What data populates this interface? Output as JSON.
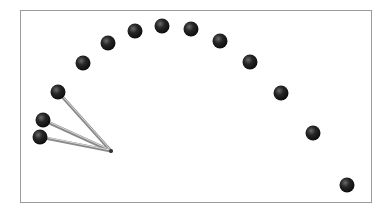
{
  "diagram": {
    "frame": {
      "x": 20,
      "y": 10,
      "width": 352,
      "height": 193,
      "border_color": "#9a9a9a"
    },
    "ball_color": "#262626",
    "stick_color": "#8a8a8a",
    "pivot": {
      "x": 111,
      "y": 151
    },
    "trajectory_balls": [
      {
        "x": 58,
        "y": 92
      },
      {
        "x": 83,
        "y": 63
      },
      {
        "x": 108,
        "y": 43
      },
      {
        "x": 135,
        "y": 31
      },
      {
        "x": 162,
        "y": 26
      },
      {
        "x": 191,
        "y": 29
      },
      {
        "x": 220,
        "y": 41
      },
      {
        "x": 250,
        "y": 62
      },
      {
        "x": 281,
        "y": 93
      },
      {
        "x": 313,
        "y": 133
      },
      {
        "x": 347,
        "y": 185
      }
    ],
    "stick_balls": [
      {
        "x": 58,
        "y": 92
      },
      {
        "x": 43,
        "y": 120
      },
      {
        "x": 40,
        "y": 137
      }
    ]
  }
}
